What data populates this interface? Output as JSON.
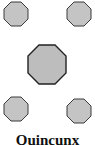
{
  "diagram": {
    "caption": "Quincunx",
    "shape": "octagon",
    "count": 5,
    "arrangement": [
      "top-left",
      "top-right",
      "center",
      "bottom-left",
      "bottom-right"
    ],
    "fill_color": "#c4c4c4",
    "stroke_color": "#3a3a3a"
  }
}
